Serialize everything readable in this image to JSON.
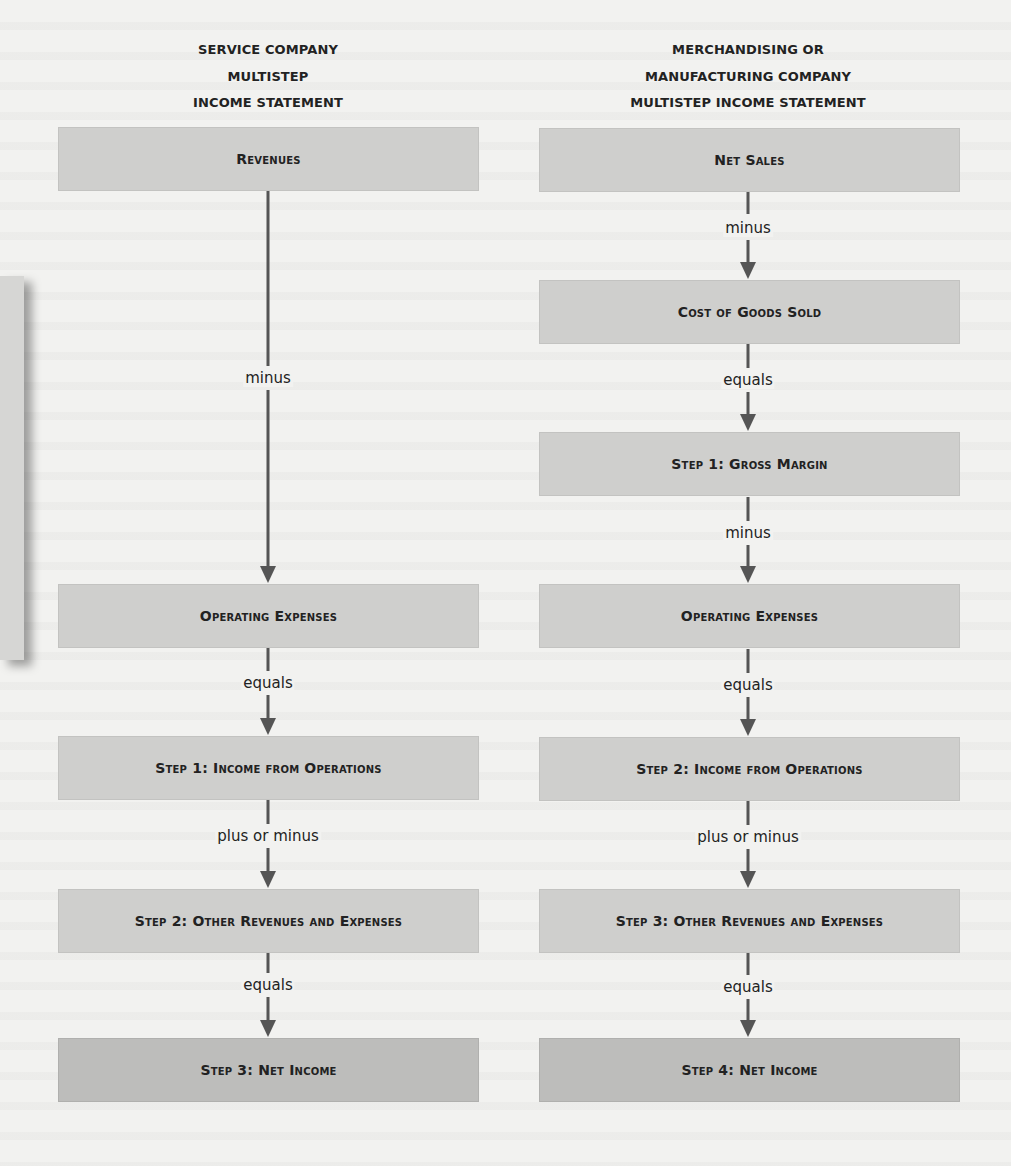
{
  "left": {
    "header": [
      "SERVICE COMPANY",
      "MULTISTEP",
      "INCOME STATEMENT"
    ],
    "boxes": {
      "revenues": "Revenues",
      "operating_expenses": "Operating Expenses",
      "income_from_operations": "Step 1: Income from Operations",
      "other_revenues_expenses": "Step 2: Other Revenues and Expenses",
      "net_income": "Step 3: Net Income"
    },
    "operators": {
      "op1": "minus",
      "op2": "equals",
      "op3": "plus or minus",
      "op4": "equals"
    }
  },
  "right": {
    "header": [
      "MERCHANDISING OR",
      "MANUFACTURING COMPANY",
      "MULTISTEP INCOME STATEMENT"
    ],
    "boxes": {
      "net_sales": "Net Sales",
      "cogs": "Cost of Goods Sold",
      "gross_margin": "Step 1: Gross Margin",
      "operating_expenses": "Operating Expenses",
      "income_from_operations": "Step 2: Income from Operations",
      "other_revenues_expenses": "Step 3: Other Revenues and Expenses",
      "net_income": "Step 4: Net Income"
    },
    "operators": {
      "op1": "minus",
      "op2": "equals",
      "op3": "minus",
      "op4": "equals",
      "op5": "plus or minus",
      "op6": "equals"
    }
  },
  "colors": {
    "background": "#f2f2f0",
    "box": "#cfcfcd",
    "final_box": "#bdbdbb",
    "arrow": "#555555",
    "text": "#222222"
  }
}
